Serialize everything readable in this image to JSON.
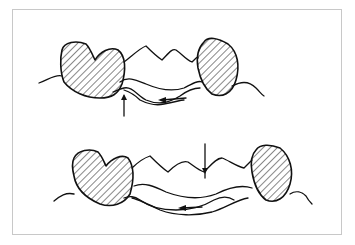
{
  "figure": {
    "panels": [
      {
        "id": "top",
        "description": "Partial denture on ridge between hatched abutment teeth; vertical arrow from below at left and horizontal arrow pointing left under saddle"
      },
      {
        "id": "bottom",
        "description": "Partial denture seated between hatched abutment teeth; vertical arrow from above on artificial teeth and horizontal arrow pointing left under saddle"
      }
    ],
    "colors": {
      "stroke": "#111111",
      "frame": "#c8c8c8",
      "background": "#ffffff"
    }
  }
}
